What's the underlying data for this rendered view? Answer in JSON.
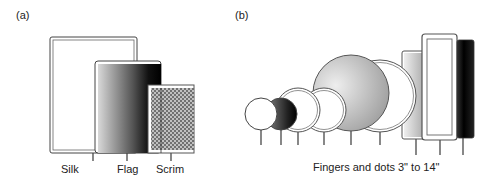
{
  "panel_a": {
    "label": "(a)",
    "items": [
      {
        "name": "Silk",
        "label": "Silk"
      },
      {
        "name": "Flag",
        "label": "Flag"
      },
      {
        "name": "Scrim",
        "label": "Scrim"
      }
    ]
  },
  "panel_b": {
    "label": "(b)",
    "caption": "Fingers and dots 3\" to 14\""
  }
}
